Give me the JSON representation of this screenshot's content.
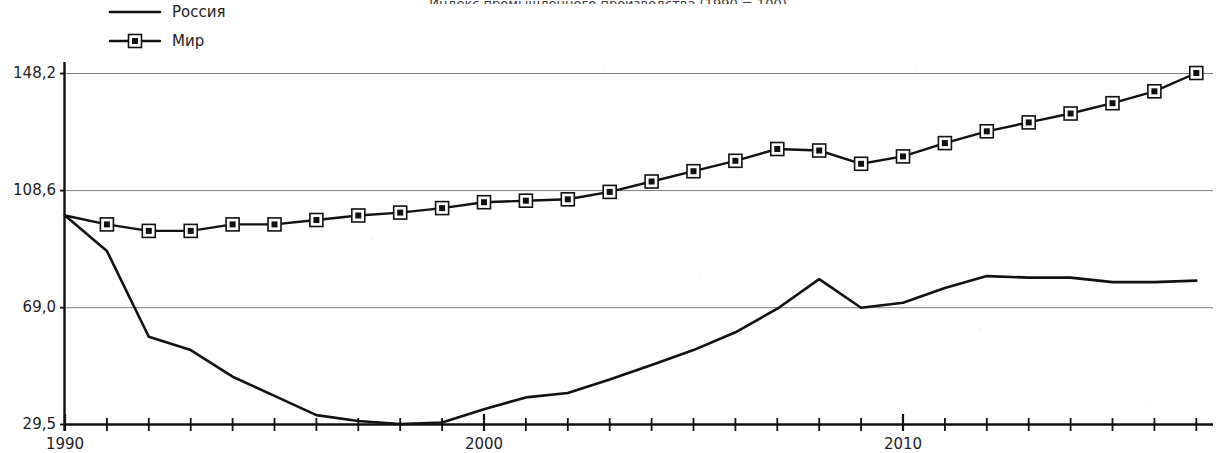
{
  "chart_data": {
    "type": "line",
    "title": "Индекс промышленного производства (1990 = 100)",
    "xlabel": "",
    "ylabel": "",
    "xlim": [
      1990,
      2017
    ],
    "ylim": [
      29.5,
      148.2
    ],
    "grid": true,
    "legend_position": "top-left",
    "y_ticks": [
      "29,5",
      "69,0",
      "108,6",
      "148,2"
    ],
    "y_tick_values": [
      29.5,
      69.0,
      108.6,
      148.2
    ],
    "x_ticks": [
      "1990",
      "2000",
      "2010"
    ],
    "x_tick_values": [
      1990,
      2000,
      2010
    ],
    "x_all_years": [
      1990,
      1991,
      1992,
      1993,
      1994,
      1995,
      1996,
      1997,
      1998,
      1999,
      2000,
      2001,
      2002,
      2003,
      2004,
      2005,
      2006,
      2007,
      2008,
      2009,
      2010,
      2011,
      2012,
      2013,
      2014,
      2015,
      2016,
      2017
    ],
    "series": [
      {
        "name": "Россия",
        "marker": "none",
        "color": "#111111",
        "x": [
          1990,
          1991,
          1992,
          1993,
          1994,
          1995,
          1996,
          1997,
          1998,
          1999,
          2000,
          2001,
          2002,
          2003,
          2004,
          2005,
          2006,
          2007,
          2008,
          2009,
          2010,
          2011,
          2012,
          2013,
          2014,
          2015,
          2016,
          2017
        ],
        "values": [
          100.0,
          88.0,
          59.0,
          54.5,
          45.5,
          39.0,
          32.5,
          30.5,
          29.5,
          30.0,
          34.5,
          38.5,
          40.0,
          44.5,
          49.5,
          54.5,
          60.5,
          68.5,
          78.5,
          68.8,
          70.5,
          75.5,
          79.5,
          79.0,
          79.0,
          77.5,
          77.5,
          78.0
        ]
      },
      {
        "name": "Мир",
        "marker": "square",
        "color": "#111111",
        "x": [
          1990,
          1991,
          1992,
          1993,
          1994,
          1995,
          1996,
          1997,
          1998,
          1999,
          2000,
          2001,
          2002,
          2003,
          2004,
          2005,
          2006,
          2007,
          2008,
          2009,
          2010,
          2011,
          2012,
          2013,
          2014,
          2015,
          2016,
          2017
        ],
        "values": [
          100.0,
          97.0,
          94.8,
          94.8,
          97.0,
          97.0,
          98.5,
          100.0,
          101.0,
          102.5,
          104.5,
          105.0,
          105.5,
          108.0,
          111.5,
          115.0,
          118.5,
          122.5,
          122.0,
          117.5,
          120.0,
          124.5,
          128.5,
          131.5,
          134.5,
          138.0,
          142.0,
          148.2
        ]
      }
    ]
  },
  "legend": {
    "items": [
      {
        "label": "Россия",
        "marker": "line"
      },
      {
        "label": "Мир",
        "marker": "line-square"
      }
    ]
  },
  "axes": {
    "y_labels": [
      "148,2",
      "108,6",
      "69,0",
      "29,5"
    ],
    "x_labels": [
      "1990",
      "2000",
      "2010"
    ]
  }
}
